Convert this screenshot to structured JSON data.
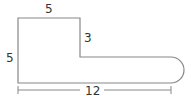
{
  "diagram": {
    "type": "composite-shape",
    "labels": {
      "top_width": "5",
      "notch_height": "3",
      "left_height": "5",
      "total_length": "12"
    },
    "colors": {
      "stroke": "#888888",
      "text": "#333333"
    }
  }
}
